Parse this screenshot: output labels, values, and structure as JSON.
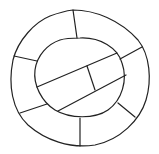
{
  "diagram": {
    "type": "hand-drawn ring diagram",
    "stroke_color": "#222222",
    "background": "#ffffff",
    "outer_ring": {
      "path": "M73,10 C95,10 120,20 138,40 C150,55 152,80 146,100 C140,120 120,140 95,145 C70,149 45,140 28,125 C12,110 8,85 13,60 C18,40 35,22 50,16 C58,13 65,11 73,10 Z"
    },
    "inner_circle": {
      "path": "M80,38 C100,37 118,48 122,63 C128,80 122,100 108,110 C95,119 70,119 55,110 C42,102 33,85 35,70 C37,55 48,44 60,40 C66,38 73,38 80,38 Z"
    },
    "ring_dividers": [
      {
        "x1": 73,
        "y1": 10,
        "x2": 77,
        "y2": 38
      },
      {
        "x1": 14,
        "y1": 56,
        "x2": 37,
        "y2": 61
      },
      {
        "x1": 20,
        "y1": 113,
        "x2": 47,
        "y2": 104
      },
      {
        "x1": 80,
        "y1": 118,
        "x2": 80,
        "y2": 146
      },
      {
        "x1": 118,
        "y1": 103,
        "x2": 135,
        "y2": 117
      },
      {
        "x1": 120,
        "y1": 59,
        "x2": 142,
        "y2": 47
      }
    ],
    "inner_band": [
      {
        "x1": 37,
        "y1": 87,
        "x2": 117,
        "y2": 53
      },
      {
        "x1": 58,
        "y1": 111,
        "x2": 126,
        "y2": 75
      },
      {
        "x1": 87,
        "y1": 66,
        "x2": 95,
        "y2": 90
      }
    ]
  }
}
